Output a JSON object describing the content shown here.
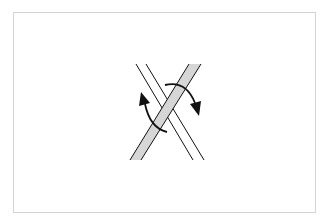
{
  "diagram": {
    "elements": [
      {
        "id": "strand-a",
        "style": "double-line",
        "from": [
          141,
          64
        ],
        "to": [
          198,
          160
        ]
      },
      {
        "id": "strand-b",
        "style": "gray-filled-band",
        "from": [
          195,
          64
        ],
        "to": [
          135,
          160
        ],
        "over": true
      },
      {
        "id": "arrow-left",
        "type": "curved-arrow",
        "direction": "counterclockwise-up"
      },
      {
        "id": "arrow-right",
        "type": "curved-arrow",
        "direction": "clockwise-down"
      }
    ],
    "colors": {
      "band_fill": "#d6d6d6",
      "stroke": "#111111",
      "border": "#d4d4d4"
    }
  }
}
